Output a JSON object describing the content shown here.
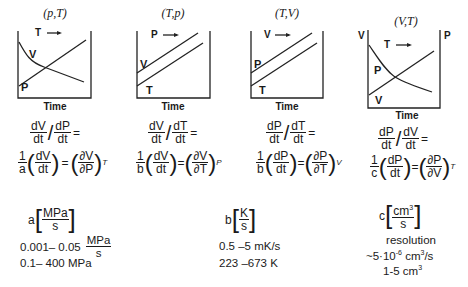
{
  "panels": [
    {
      "title": "(p,T)",
      "arrow_label": "T",
      "curves": [
        "V",
        "P"
      ],
      "xlabel": "Time",
      "eq_ratio": {
        "num1": "dV",
        "den1": "dt",
        "num2": "dP",
        "den2": "dt"
      },
      "eq_partial": {
        "coef": "a",
        "d_num": "dV",
        "d_den": "dt",
        "p_num": "∂V",
        "p_den": "∂P",
        "sub": "T"
      }
    },
    {
      "title": "(T,p)",
      "arrow_label": "P",
      "curves": [
        "V",
        "T"
      ],
      "xlabel": "Time",
      "eq_ratio": {
        "num1": "dV",
        "den1": "dt",
        "num2": "dT",
        "den2": "dt"
      },
      "eq_partial": {
        "coef": "b",
        "d_num": "dV",
        "d_den": "dt",
        "p_num": "∂V",
        "p_den": "∂T",
        "sub": "P"
      }
    },
    {
      "title": "(T,V)",
      "arrow_label": "V",
      "curves": [
        "P",
        "T"
      ],
      "xlabel": "Time",
      "eq_ratio": {
        "num1": "dP",
        "den1": "dt",
        "num2": "dT",
        "den2": "dt"
      },
      "eq_partial": {
        "coef": "b",
        "d_num": "dP",
        "d_den": "dt",
        "p_num": "∂P",
        "p_den": "∂T",
        "sub": "V"
      }
    },
    {
      "title": "(V,T)",
      "arrow_label": "T",
      "curves": [
        "P",
        "V"
      ],
      "left_axis": "V",
      "right_axis": "P",
      "xlabel": "Time",
      "eq_ratio": {
        "num1": "dP",
        "den1": "dt",
        "num2": "dV",
        "den2": "dt"
      },
      "eq_partial": {
        "coef": "c",
        "d_num": "dP",
        "d_den": "dt",
        "p_num": "∂P",
        "p_den": "∂V",
        "sub": "T"
      }
    }
  ],
  "params": {
    "a": {
      "symbol": "a",
      "unit_num": "MPa",
      "unit_den": "s",
      "rate_range": "0.001– 0.05",
      "rate_unit_num": "MPa",
      "rate_unit_den": "s",
      "range": "0.1– 400 MPa"
    },
    "b": {
      "symbol": "b",
      "unit_num": "K",
      "unit_den": "s",
      "rate_range": "0.5 –5 mK/s",
      "range": "223 –673 K"
    },
    "c": {
      "symbol": "c",
      "unit_num": "cm",
      "unit_num_sup": "3",
      "unit_den": "s",
      "resolution_label": "resolution",
      "resolution_pre": "~5·10",
      "resolution_exp": "-6",
      "resolution_post": " cm",
      "resolution_sup": "3",
      "resolution_tail": "/s",
      "range_pre": "1-5 cm",
      "range_sup": "3"
    }
  },
  "symbols": {
    "equals": "=",
    "one": "1",
    "arrow": "⟶"
  }
}
